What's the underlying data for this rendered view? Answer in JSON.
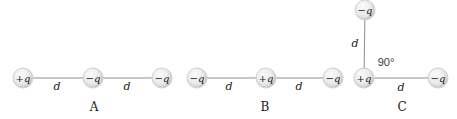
{
  "figure": {
    "colors": {
      "background": "#ffffff",
      "charge_fill": "#ececec",
      "charge_edge": "#cfcfcf",
      "line": "#8f8f8f",
      "text": "#1b1b1b"
    },
    "configurations": [
      {
        "label": "A",
        "label_pos": {
          "x": 94,
          "y": 107
        },
        "charges": [
          {
            "sign": "+q",
            "x": 23,
            "y": 78
          },
          {
            "sign": "−q",
            "x": 93,
            "y": 78
          },
          {
            "sign": "−q",
            "x": 162,
            "y": 78
          }
        ],
        "segments": [
          {
            "x1": 23,
            "y1": 78,
            "x2": 93,
            "y2": 78,
            "label": "d",
            "lx": 57,
            "ly": 86
          },
          {
            "x1": 93,
            "y1": 78,
            "x2": 162,
            "y2": 78,
            "label": "d",
            "lx": 127,
            "ly": 86
          }
        ],
        "annotations": []
      },
      {
        "label": "B",
        "label_pos": {
          "x": 265,
          "y": 107
        },
        "charges": [
          {
            "sign": "−q",
            "x": 197,
            "y": 78
          },
          {
            "sign": "+q",
            "x": 266,
            "y": 78
          },
          {
            "sign": "−q",
            "x": 333,
            "y": 78
          }
        ],
        "segments": [
          {
            "x1": 197,
            "y1": 78,
            "x2": 266,
            "y2": 78,
            "label": "d",
            "lx": 229,
            "ly": 86
          },
          {
            "x1": 266,
            "y1": 78,
            "x2": 333,
            "y2": 78,
            "label": "d",
            "lx": 299,
            "ly": 86
          }
        ],
        "annotations": []
      },
      {
        "label": "C",
        "label_pos": {
          "x": 402,
          "y": 107
        },
        "charges": [
          {
            "sign": "−q",
            "x": 365,
            "y": 10
          },
          {
            "sign": "+q",
            "x": 364,
            "y": 78
          },
          {
            "sign": "−q",
            "x": 438,
            "y": 78
          }
        ],
        "segments": [
          {
            "x1": 365,
            "y1": 10,
            "x2": 364,
            "y2": 78,
            "label": "d",
            "lx": 355,
            "ly": 43
          },
          {
            "x1": 364,
            "y1": 78,
            "x2": 438,
            "y2": 78,
            "label": "d",
            "lx": 401,
            "ly": 87
          }
        ],
        "annotations": [
          {
            "text": "90°",
            "x": 386,
            "y": 62
          }
        ]
      }
    ]
  }
}
